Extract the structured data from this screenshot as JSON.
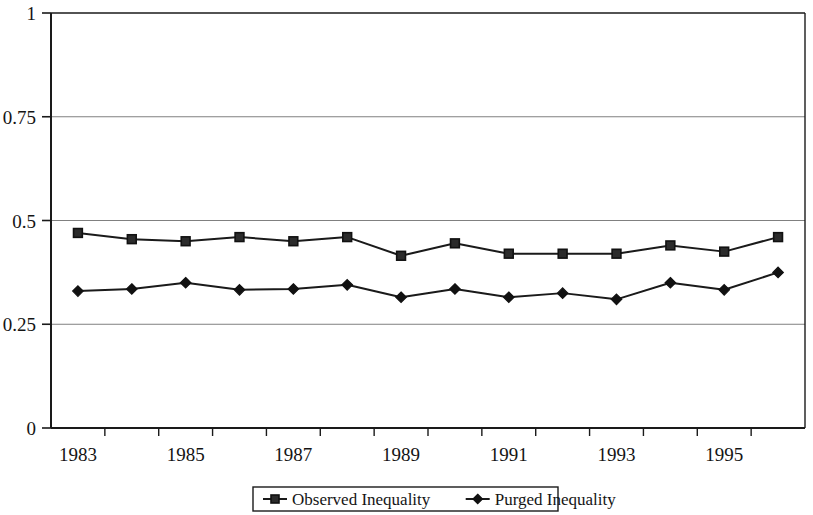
{
  "chart_data": {
    "type": "line",
    "title": "",
    "subtitle": "",
    "xlabel": "",
    "ylabel": "",
    "x": [
      1983,
      1984,
      1985,
      1986,
      1987,
      1988,
      1989,
      1990,
      1991,
      1992,
      1993,
      1994,
      1995,
      1996
    ],
    "categories": [
      "1983",
      "1984",
      "1985",
      "1986",
      "1987",
      "1988",
      "1989",
      "1990",
      "1991",
      "1992",
      "1993",
      "1994",
      "1995",
      "1996"
    ],
    "xtick_labels": [
      "1983",
      "1985",
      "1987",
      "1989",
      "1991",
      "1993",
      "1995"
    ],
    "ytick_labels": [
      "0",
      "0.25",
      "0.5",
      "0.75",
      "1"
    ],
    "yticks": [
      0,
      0.25,
      0.5,
      0.75,
      1
    ],
    "ylim": [
      0,
      1
    ],
    "grid": "horizontal",
    "legend_position": "bottom",
    "series": [
      {
        "name": "Observed Inequality",
        "marker": "square",
        "color": "#1a1a1a",
        "values": [
          0.47,
          0.455,
          0.45,
          0.46,
          0.45,
          0.46,
          0.415,
          0.445,
          0.42,
          0.42,
          0.42,
          0.44,
          0.425,
          0.46
        ]
      },
      {
        "name": "Purged Inequality",
        "marker": "diamond",
        "color": "#1a1a1a",
        "values": [
          0.33,
          0.335,
          0.35,
          0.333,
          0.335,
          0.345,
          0.315,
          0.335,
          0.315,
          0.325,
          0.31,
          0.35,
          0.333,
          0.375
        ]
      }
    ]
  },
  "legend": {
    "entries": [
      {
        "label": "Observed Inequality",
        "marker": "square"
      },
      {
        "label": "Purged Inequality",
        "marker": "diamond"
      }
    ]
  },
  "colors": {
    "line": "#1a1a1a",
    "grid": "#808080",
    "frame": "#1a1a1a",
    "background": "#ffffff"
  }
}
